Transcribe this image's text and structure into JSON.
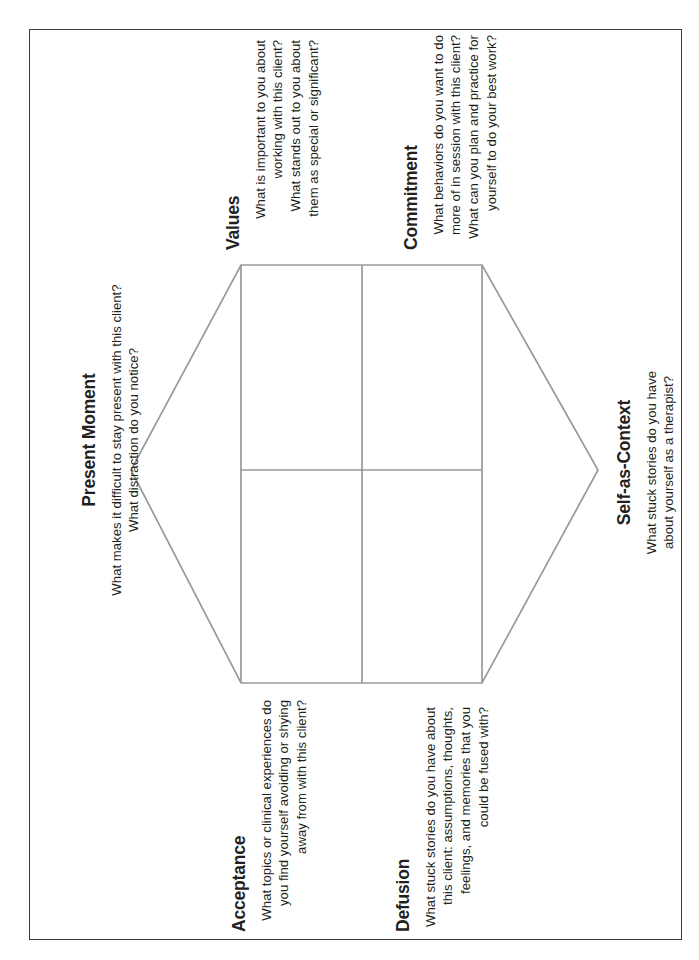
{
  "document": {
    "title": "ACT Hexaflex Therapist Self-Reflection Worksheet",
    "border_color": "#3b3b3d",
    "line_color": "#999999",
    "text_color": "#231f20",
    "background": "#ffffff"
  },
  "diagram": {
    "type": "hexagon-quadrant",
    "shape_name": "hexaflex",
    "columns": 2,
    "rows": 2,
    "quadrants": [
      "values",
      "commitment",
      "acceptance",
      "defusion"
    ],
    "points": [
      "present-moment",
      "self-as-context"
    ]
  },
  "processes": [
    {
      "id": "values",
      "heading": "Values",
      "lines": [
        "What is important to you about",
        "working with this client?",
        "What stands out to you about",
        "them as special or significant?"
      ],
      "align": "right",
      "position": "top-left"
    },
    {
      "id": "commitment",
      "heading": "Commitment",
      "lines": [
        "What behaviors do you want to do",
        "more of in session with this client?",
        "What can you plan and practice for",
        "yourself to do your best work?"
      ],
      "align": "right",
      "position": "top-right"
    },
    {
      "id": "present-moment",
      "heading": "Present Moment",
      "lines": [
        "What makes it difficult to stay present with this client?",
        "What distraction do you notice?"
      ],
      "align": "center",
      "position": "left-point"
    },
    {
      "id": "self-as-context",
      "heading": "Self-as-Context",
      "lines": [
        "What stuck stories do you have",
        "about yourself as a therapist?"
      ],
      "align": "center",
      "position": "right-point"
    },
    {
      "id": "acceptance",
      "heading": "Acceptance",
      "lines": [
        "What topics or clinical experiences do",
        "you find yourself avoiding or shying",
        "away from with this client?"
      ],
      "align": "right",
      "position": "bottom-left"
    },
    {
      "id": "defusion",
      "heading": "Defusion",
      "lines": [
        "What stuck stories do you have about",
        "this client: assumptions, thoughts,",
        "feelings, and memories that you",
        "could be fused with?"
      ],
      "align": "right",
      "position": "bottom-right"
    }
  ]
}
